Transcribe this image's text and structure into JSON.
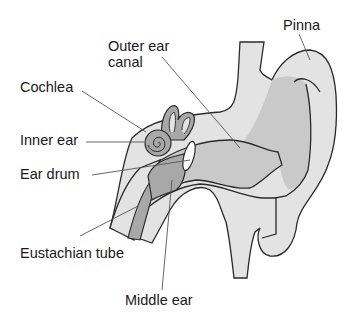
{
  "diagram": {
    "labels": {
      "outer_ear_canal_line1": "Outer ear",
      "outer_ear_canal_line2": "canal",
      "pinna": "Pinna",
      "cochlea": "Cochlea",
      "inner_ear": "Inner ear",
      "ear_drum": "Ear drum",
      "eustachian_tube": "Eustachian tube",
      "middle_ear": "Middle ear"
    },
    "colors": {
      "outline": "#2a2a2a",
      "tissue_light": "#e3e3e3",
      "tissue_mid": "#c9c9c9",
      "tissue_dark": "#a8a8a8",
      "eardrum": "#ffffff",
      "leader_line": "#555555"
    }
  }
}
